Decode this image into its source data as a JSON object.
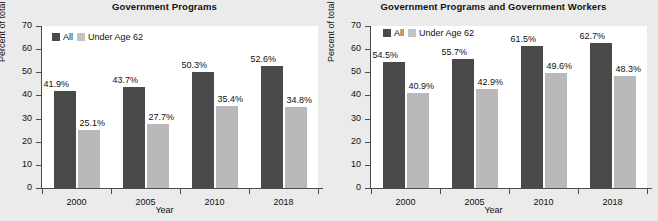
{
  "figure": {
    "background_color": "#ebebeb",
    "plot_background_color": "#ffffff",
    "series_colors": {
      "all": "#4a4a4a",
      "under_age_62": "#b9b9b9"
    }
  },
  "charts": [
    {
      "id": "government-programs",
      "title": "Government Programs",
      "xlabel": "Year",
      "ylabel": "Percent of total",
      "categories": [
        "2000",
        "2005",
        "2010",
        "2018"
      ],
      "yticks": [
        "70",
        "60",
        "50",
        "40",
        "30",
        "20",
        "10",
        "0"
      ],
      "legend": {
        "all": "All",
        "under": "Under Age 62"
      },
      "series": [
        {
          "name": "All",
          "values": [
            41.9,
            43.7,
            50.3,
            52.6
          ],
          "labels": [
            "41.9%",
            "43.7%",
            "50.3%",
            "52.6%"
          ]
        },
        {
          "name": "Under Age 62",
          "values": [
            25.1,
            27.7,
            35.4,
            34.8
          ],
          "labels": [
            "25.1%",
            "27.7%",
            "35.4%",
            "34.8%"
          ]
        }
      ]
    },
    {
      "id": "government-programs-and-workers",
      "title": "Government Programs and Government Workers",
      "xlabel": "Year",
      "ylabel": "Percent of total",
      "categories": [
        "2000",
        "2005",
        "2010",
        "2018"
      ],
      "yticks": [
        "70",
        "60",
        "50",
        "40",
        "30",
        "20",
        "10",
        "0"
      ],
      "legend": {
        "all": "All",
        "under": "Under Age 62"
      },
      "series": [
        {
          "name": "All",
          "values": [
            54.5,
            55.7,
            61.5,
            62.7
          ],
          "labels": [
            "54.5%",
            "55.7%",
            "61.5%",
            "62.7%"
          ]
        },
        {
          "name": "Under Age 62",
          "values": [
            40.9,
            42.9,
            49.6,
            48.3
          ],
          "labels": [
            "40.9%",
            "42.9%",
            "49.6%",
            "48.3%"
          ]
        }
      ]
    }
  ],
  "chart_data": [
    {
      "type": "bar",
      "title": "Government Programs",
      "xlabel": "Year",
      "ylabel": "Percent of total",
      "categories": [
        "2000",
        "2005",
        "2010",
        "2018"
      ],
      "series": [
        {
          "name": "All",
          "values": [
            41.9,
            43.7,
            50.3,
            52.6
          ]
        },
        {
          "name": "Under Age 62",
          "values": [
            25.1,
            27.7,
            35.4,
            34.8
          ]
        }
      ],
      "ylim": [
        0,
        70
      ],
      "ytick_step": 10,
      "grid": false,
      "legend_position": "top-left",
      "data_labels": true
    },
    {
      "type": "bar",
      "title": "Government Programs and Government Workers",
      "xlabel": "Year",
      "ylabel": "Percent of total",
      "categories": [
        "2000",
        "2005",
        "2010",
        "2018"
      ],
      "series": [
        {
          "name": "All",
          "values": [
            54.5,
            55.7,
            61.5,
            62.7
          ]
        },
        {
          "name": "Under Age 62",
          "values": [
            40.9,
            42.9,
            49.6,
            48.3
          ]
        }
      ],
      "ylim": [
        0,
        70
      ],
      "ytick_step": 10,
      "grid": false,
      "legend_position": "top-left",
      "data_labels": true
    }
  ]
}
